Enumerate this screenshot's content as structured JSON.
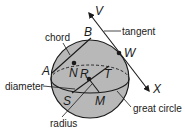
{
  "diagram": {
    "type": "sphere-geometry",
    "colors": {
      "sphere_fill": "#b8b8b8",
      "stroke": "#1a1a1a",
      "background": "#ffffff"
    },
    "points": {
      "A": "A",
      "B": "B",
      "N": "N",
      "R": "R",
      "T": "T",
      "S": "S",
      "M": "M",
      "W": "W",
      "V": "V",
      "X": "X"
    },
    "labels": {
      "chord": "chord",
      "tangent": "tangent",
      "diameter": "diameter",
      "great_circle": "great circle",
      "radius": "radius"
    }
  }
}
